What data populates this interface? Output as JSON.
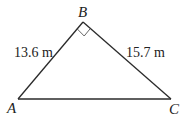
{
  "diagram": {
    "type": "right-triangle",
    "vertices": {
      "A": {
        "label": "A",
        "x": 18,
        "y": 99
      },
      "B": {
        "label": "B",
        "x": 83,
        "y": 22
      },
      "C": {
        "label": "C",
        "x": 171,
        "y": 99
      }
    },
    "right_angle_at": "B",
    "sides": {
      "AB": {
        "label": "13.6 m",
        "value": 13.6,
        "unit": "m"
      },
      "BC": {
        "label": "15.7 m",
        "value": 15.7,
        "unit": "m"
      },
      "AC": {
        "label": ""
      }
    },
    "colors": {
      "line": "#2a2a2a",
      "right_angle_marker": "#555555",
      "text": "#222222",
      "background": "#ffffff"
    }
  }
}
